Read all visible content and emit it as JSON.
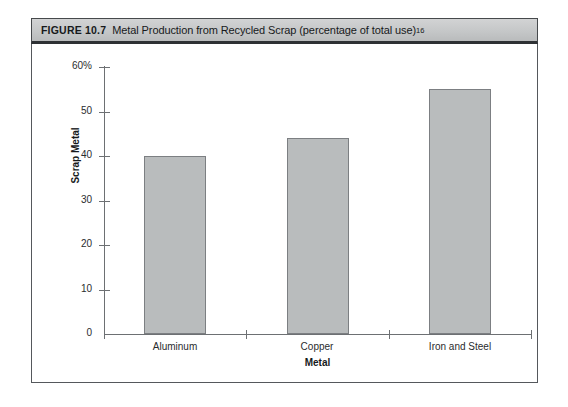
{
  "caption": {
    "number": "FIGURE 10.7",
    "text": "Metal Production from Recycled Scrap (percentage of total use)",
    "superscript": "16"
  },
  "chart_data": {
    "type": "bar",
    "title": "Metal Production from Recycled Scrap (percentage of total use)",
    "categories": [
      "Aluminum",
      "Copper",
      "Iron and Steel"
    ],
    "values": [
      40,
      44,
      55
    ],
    "xlabel": "Metal",
    "ylabel": "Scrap Metal",
    "ylim": [
      0,
      60
    ],
    "yticks": [
      0,
      10,
      20,
      30,
      40,
      50,
      60
    ],
    "ytick_labels": [
      "0",
      "10",
      "20",
      "30",
      "40",
      "50",
      "60%"
    ],
    "grid": false,
    "legend": false,
    "bar_color": "#b9bcbd",
    "bar_border_color": "#7c7f82",
    "axis_color": "#6d7073"
  }
}
